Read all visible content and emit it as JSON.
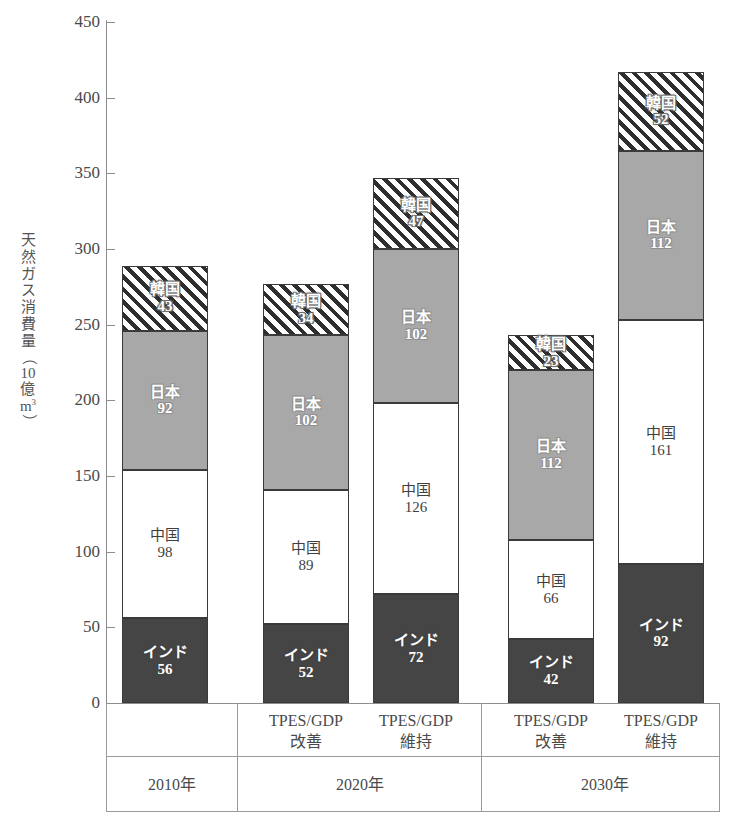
{
  "chart_data": {
    "type": "bar",
    "subtype": "stacked-bar",
    "title": "",
    "xlabel": "",
    "ylabel": "天然ガス消費量（10億m3）",
    "ylabel_chars": [
      "天",
      "然",
      "ガ",
      "ス",
      "消",
      "費",
      "量"
    ],
    "ylabel_unit_open": "（",
    "ylabel_unit_num": "10",
    "ylabel_unit_oku": "億",
    "ylabel_unit_m": "m",
    "ylabel_unit_sup": "3",
    "ylabel_unit_close": "）",
    "ylim": [
      0,
      450
    ],
    "ytick_step": 50,
    "yticks": [
      0,
      50,
      100,
      150,
      200,
      250,
      300,
      350,
      400,
      450
    ],
    "grid": false,
    "legend_position": "in-segment-labels",
    "categories": [
      "2010年",
      "2020年 TPES/GDP 改善",
      "2020年 TPES/GDP 維持",
      "2030年 TPES/GDP 改善",
      "2030年 TPES/GDP 維持"
    ],
    "series": [
      {
        "name": "インド",
        "key": "india",
        "fill": "#454545",
        "pattern": "solid-dark",
        "values": [
          56,
          52,
          72,
          42,
          92
        ]
      },
      {
        "name": "中国",
        "key": "china",
        "fill": "#ffffff",
        "pattern": "solid-white",
        "values": [
          98,
          89,
          126,
          66,
          161
        ]
      },
      {
        "name": "日本",
        "key": "japan",
        "fill": "#a8a8a8",
        "pattern": "solid-gray",
        "values": [
          92,
          102,
          102,
          112,
          112
        ]
      },
      {
        "name": "韓国",
        "key": "korea",
        "fill": "#2e2e2e",
        "pattern": "diagonal-hatch",
        "values": [
          43,
          34,
          47,
          23,
          52
        ]
      }
    ],
    "totals": [
      289,
      277,
      347,
      243,
      417
    ]
  },
  "bars": [
    {
      "id": "bar-2010",
      "left": 122,
      "segments": [
        {
          "name": "インド",
          "value": "56",
          "key": "india"
        },
        {
          "name": "中国",
          "value": "98",
          "key": "china"
        },
        {
          "name": "日本",
          "value": "92",
          "key": "japan"
        },
        {
          "name": "韓国",
          "value": "43",
          "key": "korea"
        }
      ]
    },
    {
      "id": "bar-2020-kaizen",
      "left": 263,
      "segments": [
        {
          "name": "インド",
          "value": "52",
          "key": "india"
        },
        {
          "name": "中国",
          "value": "89",
          "key": "china"
        },
        {
          "name": "日本",
          "value": "102",
          "key": "japan"
        },
        {
          "name": "韓国",
          "value": "34",
          "key": "korea"
        }
      ]
    },
    {
      "id": "bar-2020-iji",
      "left": 373,
      "segments": [
        {
          "name": "インド",
          "value": "72",
          "key": "india"
        },
        {
          "name": "中国",
          "value": "126",
          "key": "china"
        },
        {
          "name": "日本",
          "value": "102",
          "key": "japan"
        },
        {
          "name": "韓国",
          "value": "47",
          "key": "korea"
        }
      ]
    },
    {
      "id": "bar-2030-kaizen",
      "left": 508,
      "segments": [
        {
          "name": "インド",
          "value": "42",
          "key": "india"
        },
        {
          "name": "中国",
          "value": "66",
          "key": "china"
        },
        {
          "name": "日本",
          "value": "112",
          "key": "japan"
        },
        {
          "name": "韓国",
          "value": "23",
          "key": "korea"
        }
      ]
    },
    {
      "id": "bar-2030-iji",
      "left": 618,
      "segments": [
        {
          "name": "インド",
          "value": "92",
          "key": "india"
        },
        {
          "name": "中国",
          "value": "161",
          "key": "china"
        },
        {
          "name": "日本",
          "value": "112",
          "key": "japan"
        },
        {
          "name": "韓国",
          "value": "52",
          "key": "korea"
        }
      ]
    }
  ],
  "xaxis": {
    "scenario_labels": [
      {
        "line1": "TPES/GDP",
        "line2": "改善",
        "center": 306
      },
      {
        "line1": "TPES/GDP",
        "line2": "維持",
        "center": 416
      },
      {
        "line1": "TPES/GDP",
        "line2": "改善",
        "center": 551
      },
      {
        "line1": "TPES/GDP",
        "line2": "維持",
        "center": 661
      }
    ],
    "group_labels": [
      {
        "text": "2010年",
        "center": 172
      },
      {
        "text": "2020年",
        "center": 360
      },
      {
        "text": "2030年",
        "center": 605
      }
    ]
  },
  "colors": {
    "india": "#454545",
    "china": "#ffffff",
    "japan": "#a8a8a8",
    "korea_hatch": "#2e2e2e",
    "axis": "#8d8d8d",
    "text": "#4a4a4a"
  }
}
